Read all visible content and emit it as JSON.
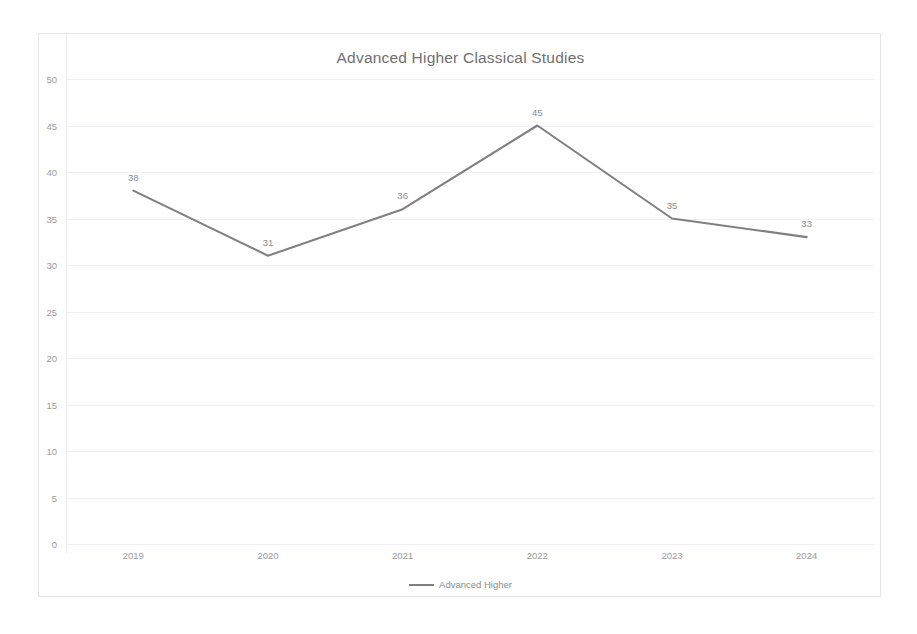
{
  "chart_data": {
    "type": "line",
    "title": "Advanced Higher Classical Studies",
    "xlabel": "",
    "ylabel": "",
    "categories": [
      "2019",
      "2020",
      "2021",
      "2022",
      "2023",
      "2024"
    ],
    "series": [
      {
        "name": "Advanced Higher",
        "values": [
          38,
          31,
          36,
          45,
          35,
          33
        ],
        "color": "#808080"
      }
    ],
    "data_labels": [
      "38",
      "31",
      "36",
      "45",
      "35",
      "33"
    ],
    "ylim": [
      0,
      50
    ],
    "ytick_values": [
      50,
      45,
      40,
      35,
      30,
      25,
      20,
      15,
      10,
      5,
      0
    ],
    "ytick_labels": [
      "50",
      "45",
      "40",
      "35",
      "30",
      "25",
      "20",
      "15",
      "10",
      "5",
      "0"
    ],
    "grid": true,
    "grid_color": "#f1eff3",
    "legend": {
      "position": "bottom",
      "entries": [
        "Advanced Higher"
      ]
    },
    "frame_color": "#e6e6e6",
    "text_color": "#9a9a9a",
    "background": "#ffffff"
  }
}
